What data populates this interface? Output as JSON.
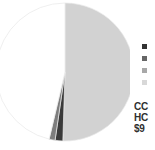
{
  "chart_data": {
    "type": "pie",
    "title": "",
    "legend_position": "right",
    "grid": false,
    "categories": [
      "Slice A",
      "Slice B",
      "Slice C",
      "Slice D"
    ],
    "values": [
      50.5,
      1.8,
      1.4,
      46.3
    ],
    "colors": [
      "#d2d2d2",
      "#3a3a3a",
      "#7d7d7d",
      "#ffffff"
    ],
    "labels": [
      "",
      "",
      "",
      ""
    ],
    "start_angle": 0,
    "stroke": "#e8e8e8"
  },
  "legend": {
    "items": [
      {
        "label": "",
        "color": "#333333"
      },
      {
        "label": "",
        "color": "#666666"
      },
      {
        "label": "",
        "color": "#a8a8a8"
      },
      {
        "label": "",
        "color": "#d8d8d8"
      }
    ]
  },
  "caption": {
    "lines": [
      "CC",
      "HC",
      "$9"
    ]
  },
  "canvas": {
    "background": "#ffffff"
  }
}
